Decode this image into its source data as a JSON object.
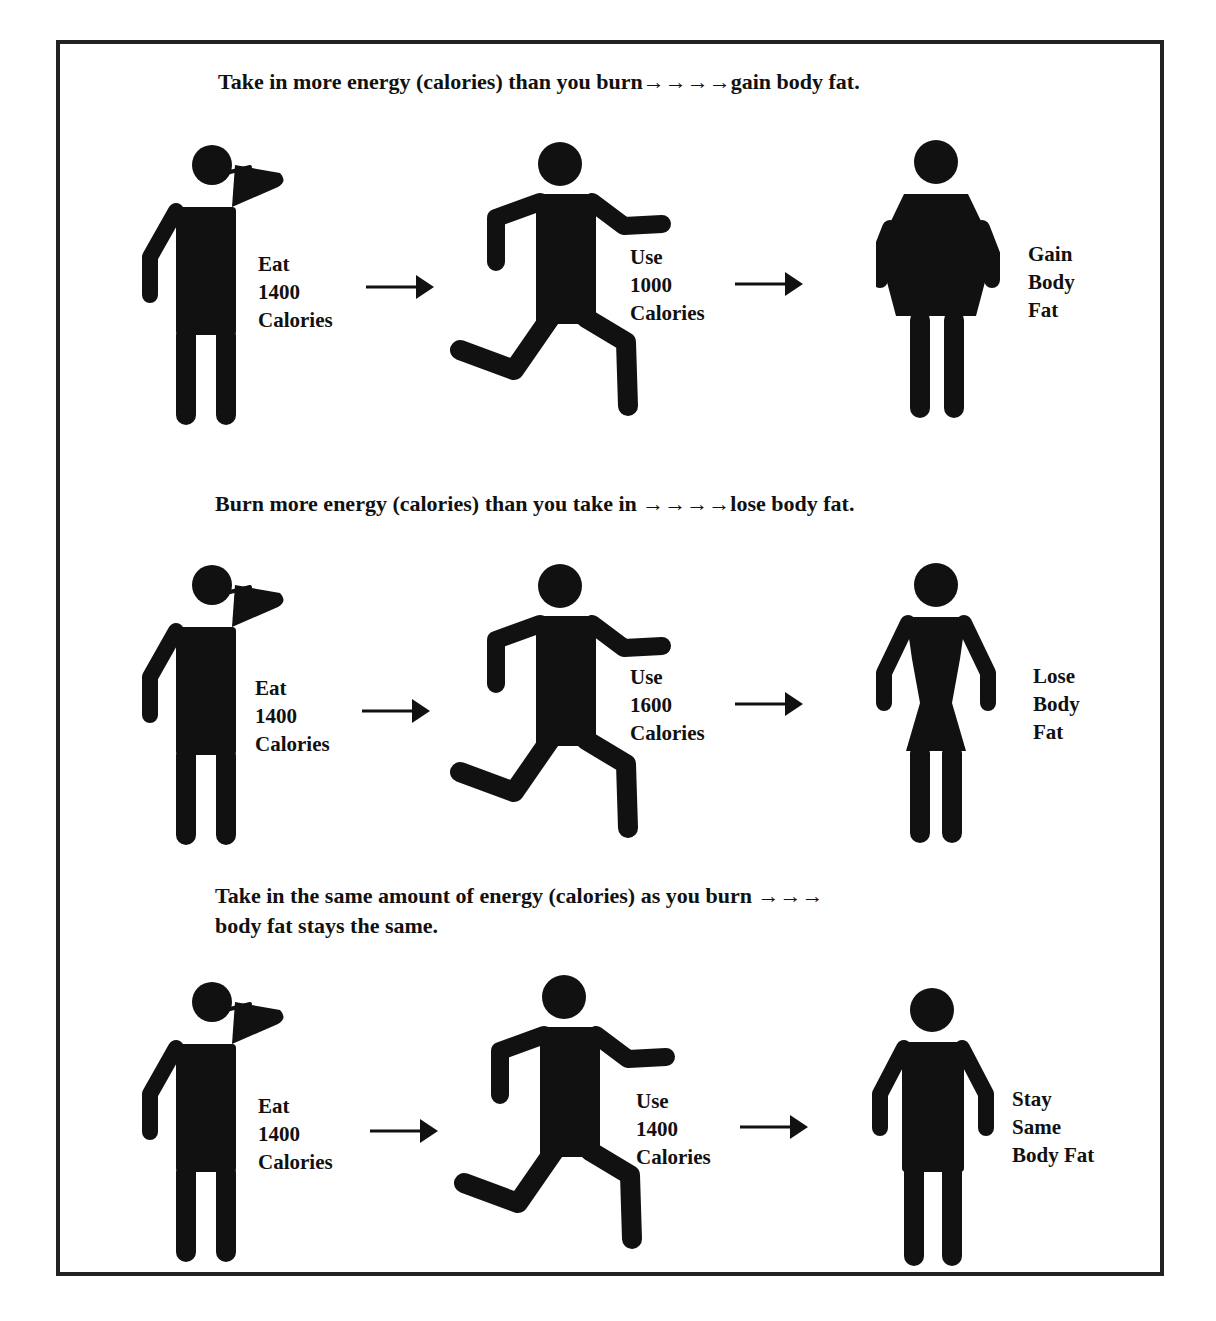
{
  "rows": [
    {
      "heading": "Take in more energy (calories) than you burn→→→→gain body fat.",
      "eat_label": "Eat\n1400\nCalories",
      "use_label": "Use\n1000\nCalories",
      "result_label": "Gain\nBody\nFat",
      "result_figure": "heavier-figure"
    },
    {
      "heading": "Burn more energy (calories) than you take in →→→→lose body fat.",
      "eat_label": "Eat\n1400\nCalories",
      "use_label": "Use\n1600\nCalories",
      "result_label": "Lose\nBody\nFat",
      "result_figure": "slimmer-figure"
    },
    {
      "heading_line1": "Take in the same amount of energy (calories) as you burn →→→",
      "heading_line2": "body fat stays the same.",
      "eat_label": "Eat\n1400\nCalories",
      "use_label": "Use\n1400\nCalories",
      "result_label": "Stay\nSame\nBody Fat",
      "result_figure": "standard-figure"
    }
  ],
  "colors": {
    "ink": "#111111",
    "background": "#ffffff",
    "border": "#222222"
  }
}
